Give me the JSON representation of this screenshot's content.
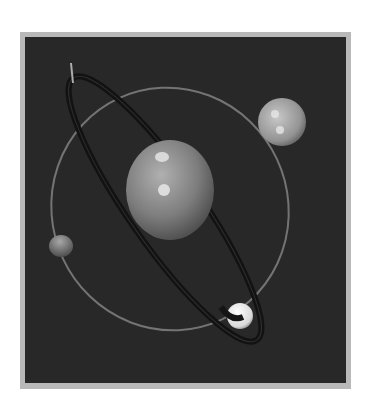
{
  "image": {
    "subject": "atom model render",
    "style": "grayscale 3D render",
    "colors": {
      "frame": "#b9b9b9",
      "background": "#282828",
      "orbit_light": "#9a9a9a",
      "orbit_dark": "#151515"
    },
    "spheres": [
      {
        "name": "nucleus",
        "cx": 145,
        "cy": 153,
        "r": 47,
        "fill": "#8c8c8c"
      },
      {
        "name": "electron-upper-right",
        "cx": 257,
        "cy": 85,
        "r": 24,
        "fill": "#a5a5a5"
      },
      {
        "name": "electron-left",
        "cx": 36,
        "cy": 209,
        "r": 12,
        "fill": "#7a7a7a"
      },
      {
        "name": "electron-bottom",
        "cx": 215,
        "cy": 279,
        "r": 13,
        "fill": "#e6e6e6"
      }
    ]
  }
}
